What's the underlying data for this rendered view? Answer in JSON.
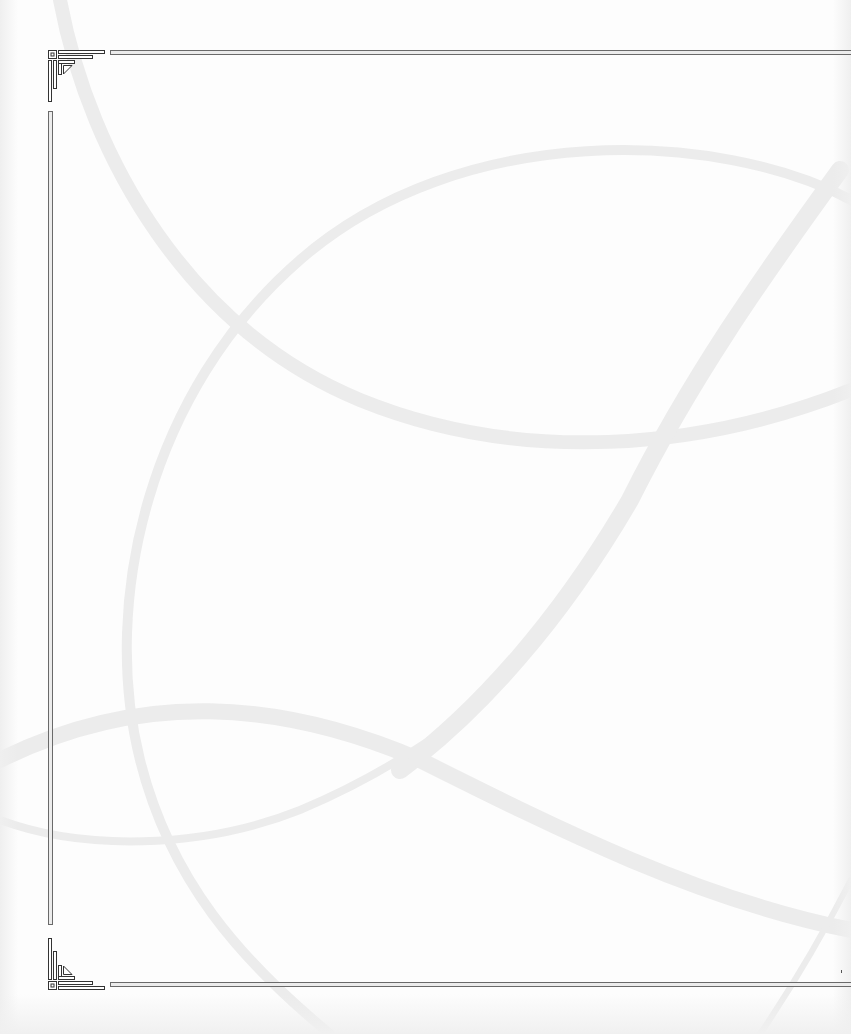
{
  "page": {
    "type": "blank decorative page",
    "background_color": "#fdfdfd",
    "swoosh_color": "#ededed",
    "frame_color": "#6a6a6a",
    "frame_fill": "#ececec"
  },
  "frame": {
    "top_line": {
      "x": 110,
      "y": 50,
      "width": 741
    },
    "bottom_line": {
      "x": 110,
      "y": 982,
      "width": 741
    },
    "left_line": {
      "x": 48,
      "y": 111,
      "height": 814
    },
    "corners": [
      "top-left-ornament",
      "bottom-left-ornament"
    ]
  },
  "decorations": {
    "swooshes": [
      "upper-arc",
      "large-loop",
      "diagonal-ribbon",
      "lower-wave",
      "lower-left-loop"
    ]
  }
}
